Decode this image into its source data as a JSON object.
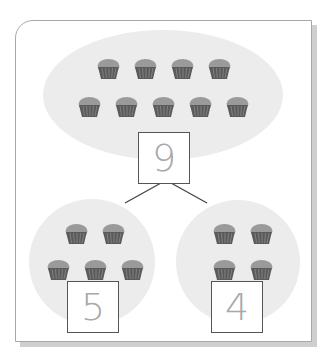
{
  "diagram": {
    "type": "part-whole number bond",
    "whole": {
      "value": "9",
      "item_count": 9,
      "item_icon": "muffin-icon"
    },
    "parts": [
      {
        "value": "5",
        "item_count": 5,
        "item_icon": "muffin-icon"
      },
      {
        "value": "4",
        "item_count": 4,
        "item_icon": "muffin-icon"
      }
    ],
    "colors": {
      "blob": "#ececec",
      "box_border": "#555555",
      "number": "#a9a9a9",
      "muffin_top": "#9a9a9a",
      "muffin_case": "#5a5a5a"
    }
  }
}
